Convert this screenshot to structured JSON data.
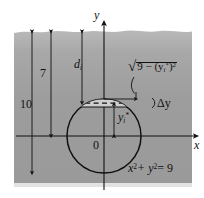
{
  "figure": {
    "colors": {
      "water_fill": "#9e9e9e",
      "water_fill_top": "#b4b4b4",
      "outline": "#111111",
      "strip_fill": "#c9c9c9",
      "page_background": "#ffffff"
    },
    "axes": {
      "y_label": "y",
      "x_label": "x",
      "origin_label": "0"
    },
    "labels": {
      "depth_total": "10",
      "depth_surface_to_axis": "7",
      "depth_to_strip": "d",
      "depth_to_strip_sub": "i",
      "half_width_radical": "9 − (y",
      "half_width_radical_sub": "i",
      "half_width_radical_star": "*",
      "half_width_radical_tail": ")",
      "half_width_radical_exp": "2",
      "strip_thickness": "Δy",
      "sample_point": "y",
      "sample_point_sub": "i",
      "sample_point_star": "*",
      "circle_equation_x": "x",
      "circle_equation_xexp": "2",
      "circle_equation_plus": "+ y",
      "circle_equation_yexp": "2",
      "circle_equation_rhs": "= 9"
    },
    "geometry": {
      "circle_center_x": 104,
      "circle_center_y": 136,
      "circle_radius": 37,
      "strip_top_y": 99,
      "strip_bottom_y": 107,
      "water_surface_y": 31,
      "water_bottom_y": 183
    }
  }
}
